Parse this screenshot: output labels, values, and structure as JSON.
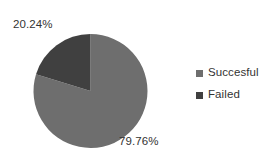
{
  "chart_data": {
    "type": "pie",
    "title": "",
    "labels": [
      "Succesful",
      "Failed"
    ],
    "values": [
      79.76,
      20.24
    ],
    "value_labels": [
      "79.76%",
      "20.24%"
    ],
    "colors": [
      "#6e6e6e",
      "#404040"
    ],
    "units": "percent",
    "start_angle_deg": 90,
    "direction": "counterclockwise",
    "legend": {
      "position": "right",
      "entries": [
        {
          "label": "Succesful",
          "color": "#6e6e6e",
          "marker": "square"
        },
        {
          "label": "Failed",
          "color": "#404040",
          "marker": "square"
        }
      ]
    },
    "grid": false,
    "xlabel": "",
    "ylabel": ""
  },
  "figure": {
    "background": "#ffffff",
    "text_color": "#333333"
  },
  "geometry": {
    "center_x": 90.5,
    "center_y": 91,
    "radius": 57
  }
}
